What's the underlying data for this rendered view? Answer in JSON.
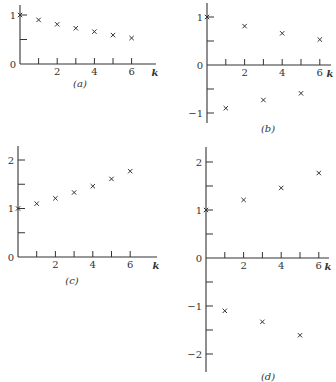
{
  "chart_data": [
    {
      "panel": "(a)",
      "type": "scatter",
      "marker": "x",
      "xlabel": "k",
      "ylabel": "",
      "x": [
        0,
        1,
        2,
        3,
        4,
        5,
        6
      ],
      "values": [
        1.0,
        0.9,
        0.81,
        0.73,
        0.66,
        0.59,
        0.53
      ],
      "xticks": [
        0,
        1,
        2,
        3,
        4,
        5,
        6
      ],
      "xtick_labels": [
        "",
        "",
        "2",
        "",
        "4",
        "",
        "6"
      ],
      "yticks": [
        0,
        0.5,
        1
      ],
      "ytick_labels": [
        "0",
        "",
        "1"
      ],
      "xlim": [
        0,
        7
      ],
      "ylim": [
        0,
        1.3
      ],
      "grid": false
    },
    {
      "panel": "(b)",
      "type": "scatter",
      "marker": "x",
      "xlabel": "k",
      "ylabel": "",
      "x": [
        0,
        1,
        2,
        3,
        4,
        5,
        6
      ],
      "values": [
        1.0,
        -0.9,
        0.81,
        -0.73,
        0.66,
        -0.59,
        0.53
      ],
      "xticks": [
        0,
        1,
        2,
        3,
        4,
        5,
        6
      ],
      "xtick_labels": [
        "",
        "",
        "2",
        "",
        "4",
        "",
        "6"
      ],
      "yticks": [
        -1,
        -0.5,
        0,
        0.5,
        1
      ],
      "ytick_labels": [
        "−1",
        "",
        "0",
        "",
        "1"
      ],
      "xlim": [
        0,
        7
      ],
      "ylim": [
        -1.2,
        1.3
      ],
      "grid": false
    },
    {
      "panel": "(c)",
      "type": "scatter",
      "marker": "x",
      "xlabel": "k",
      "ylabel": "",
      "x": [
        0,
        1,
        2,
        3,
        4,
        5,
        6
      ],
      "values": [
        1.0,
        1.1,
        1.21,
        1.33,
        1.46,
        1.61,
        1.77
      ],
      "xticks": [
        0,
        1,
        2,
        3,
        4,
        5,
        6
      ],
      "xtick_labels": [
        "",
        "",
        "2",
        "",
        "4",
        "",
        "6"
      ],
      "yticks": [
        0,
        0.5,
        1,
        1.5,
        2
      ],
      "ytick_labels": [
        "0",
        "",
        "1",
        "",
        "2"
      ],
      "xlim": [
        0,
        7
      ],
      "ylim": [
        0,
        2.3
      ],
      "grid": false
    },
    {
      "panel": "(d)",
      "type": "scatter",
      "marker": "x",
      "xlabel": "k",
      "ylabel": "",
      "x": [
        0,
        1,
        2,
        3,
        4,
        5,
        6
      ],
      "values": [
        1.0,
        -1.1,
        1.21,
        -1.33,
        1.46,
        -1.61,
        1.77
      ],
      "xticks": [
        0,
        1,
        2,
        3,
        4,
        5,
        6
      ],
      "xtick_labels": [
        "",
        "",
        "2",
        "",
        "4",
        "",
        "6"
      ],
      "yticks": [
        -2,
        -1.5,
        -1,
        -0.5,
        0,
        0.5,
        1,
        1.5,
        2
      ],
      "ytick_labels": [
        "−2",
        "",
        "−1",
        "",
        "0",
        "",
        "1",
        "",
        "2"
      ],
      "xlim": [
        0,
        7
      ],
      "ylim": [
        -2.4,
        2.3
      ],
      "grid": false
    }
  ],
  "layout": [
    {
      "x0": 20,
      "y0": 64,
      "xu": 18.6,
      "yu": 49,
      "xend": 156,
      "ytop": 5,
      "ybot": 64,
      "label_x": 80,
      "label_y": 87
    },
    {
      "x0": 207,
      "y0": 65,
      "xu": 18.8,
      "yu": 48,
      "xend": 331,
      "ytop": 3,
      "ybot": 123,
      "label_x": 268,
      "label_y": 132
    },
    {
      "x0": 18,
      "y0": 257,
      "xu": 18.7,
      "yu": 48.5,
      "xend": 157,
      "ytop": 146,
      "ybot": 257,
      "label_x": 72,
      "label_y": 284
    },
    {
      "x0": 206,
      "y0": 258,
      "xu": 18.8,
      "yu": 48,
      "xend": 329,
      "ytop": 147,
      "ybot": 372,
      "label_x": 268,
      "label_y": 380
    }
  ]
}
